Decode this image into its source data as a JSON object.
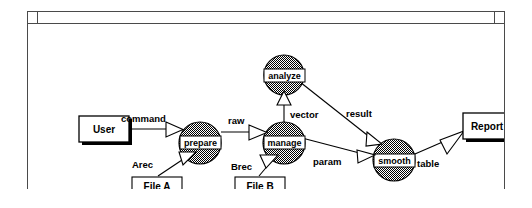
{
  "window": {
    "title": "",
    "buttons": [
      {
        "name": "window-menu-button",
        "label": ""
      },
      {
        "name": "window-resize-button",
        "label": ""
      }
    ]
  },
  "diagram": {
    "type": "dataflow-diagram",
    "colors": {
      "node_fill": "#8a8a8a",
      "node_stroke": "#000000",
      "box_fill": "#ffffff",
      "box_stroke": "#000000",
      "edge_stroke": "#000000",
      "arrowhead_fill": "#ffffff",
      "canvas_bg": "#ffffff",
      "frame_stroke": "#4a4a4a"
    },
    "process_nodes": [
      {
        "id": "prepare",
        "label": "prepare",
        "cx": 172,
        "cy": 120,
        "r": 21
      },
      {
        "id": "manage",
        "label": "manage",
        "cx": 255,
        "cy": 120,
        "r": 21
      },
      {
        "id": "analyze",
        "label": "analyze",
        "cx": 256,
        "cy": 52,
        "r": 20
      },
      {
        "id": "smooth",
        "label": "smooth",
        "cx": 366,
        "cy": 137,
        "r": 21
      }
    ],
    "terminal_boxes": [
      {
        "id": "user",
        "label": "User",
        "x": 51,
        "y": 103,
        "w": 50,
        "h": 27,
        "shadow": true
      },
      {
        "id": "report",
        "label": "Report",
        "x": 435,
        "y": 101,
        "w": 48,
        "h": 27,
        "shadow": true
      },
      {
        "id": "file-a",
        "label": "File A",
        "x": 104,
        "y": 166,
        "w": 50,
        "h": 18,
        "shadow": false
      },
      {
        "id": "file-b",
        "label": "File B",
        "x": 207,
        "y": 166,
        "w": 50,
        "h": 18,
        "shadow": false
      }
    ],
    "edges": [
      {
        "id": "user-prepare",
        "label": "command",
        "from": "user",
        "to": "prepare"
      },
      {
        "id": "file-a-prepare",
        "label": "Arec",
        "from": "file-a",
        "to": "prepare"
      },
      {
        "id": "prepare-manage",
        "label": "raw",
        "from": "prepare",
        "to": "manage"
      },
      {
        "id": "file-b-manage",
        "label": "Brec",
        "from": "file-b",
        "to": "manage"
      },
      {
        "id": "manage-analyze",
        "label": "vector",
        "from": "manage",
        "to": "analyze"
      },
      {
        "id": "analyze-smooth",
        "label": "result",
        "from": "analyze",
        "to": "smooth"
      },
      {
        "id": "manage-smooth",
        "label": "param",
        "from": "manage",
        "to": "smooth"
      },
      {
        "id": "smooth-report",
        "label": "table",
        "from": "smooth",
        "to": "report"
      }
    ],
    "edge_label_positions": {
      "command": {
        "x": 112,
        "y": 106
      },
      "Arec": {
        "x": 123,
        "y": 149
      },
      "raw": {
        "x": 208,
        "y": 107
      },
      "Brec": {
        "x": 222,
        "y": 151
      },
      "vector": {
        "x": 266,
        "y": 92
      },
      "result": {
        "x": 334,
        "y": 99
      },
      "param": {
        "x": 300,
        "y": 144
      },
      "table": {
        "x": 400,
        "y": 145
      }
    }
  }
}
